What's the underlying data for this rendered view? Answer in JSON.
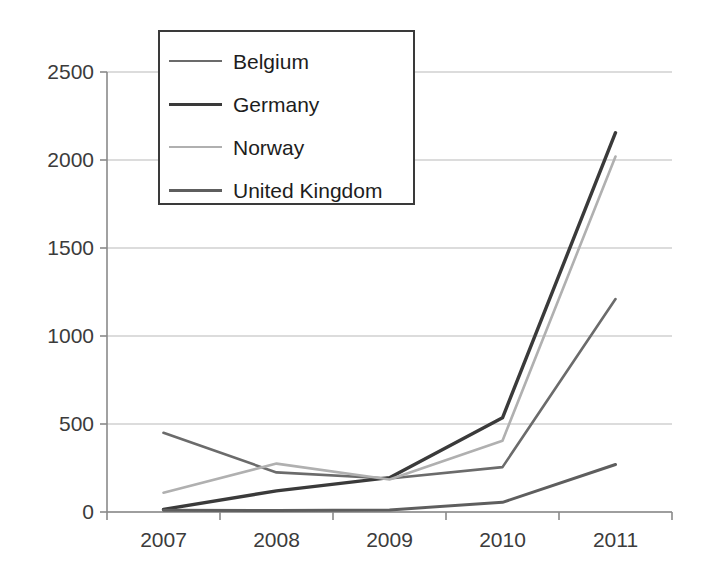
{
  "chart_data": {
    "type": "line",
    "title": "",
    "xlabel": "",
    "ylabel": "",
    "categories": [
      "2007",
      "2008",
      "2009",
      "2010",
      "2011"
    ],
    "ylim": [
      0,
      2500
    ],
    "yticks": [
      0,
      500,
      1000,
      1500,
      2000,
      2500
    ],
    "ytick_labels": [
      "0",
      "500",
      "1000",
      "1500",
      "2000",
      "2500"
    ],
    "grid": true,
    "grid_axis": "y",
    "legend_position": "top-left inside plot",
    "series": [
      {
        "name": "Belgium",
        "color": "#6b6b6b",
        "width": 2.6,
        "values": [
          450,
          225,
          190,
          255,
          1210
        ]
      },
      {
        "name": "Germany",
        "color": "#3a3a3a",
        "width": 3.4,
        "values": [
          15,
          120,
          195,
          535,
          2155
        ]
      },
      {
        "name": "Norway",
        "color": "#b0b0b0",
        "width": 2.6,
        "values": [
          110,
          275,
          185,
          405,
          2020
        ]
      },
      {
        "name": "United Kingdom",
        "color": "#5e5e5e",
        "width": 3.0,
        "values": [
          10,
          8,
          12,
          55,
          270
        ]
      }
    ]
  },
  "axis": {
    "line_color": "#8a8a8a",
    "grid_color": "#b9b9b9",
    "tick_color": "#8a8a8a"
  },
  "legend": {
    "entries": [
      {
        "label": "Belgium"
      },
      {
        "label": "Germany"
      },
      {
        "label": "Norway"
      },
      {
        "label": "United Kingdom"
      }
    ]
  }
}
